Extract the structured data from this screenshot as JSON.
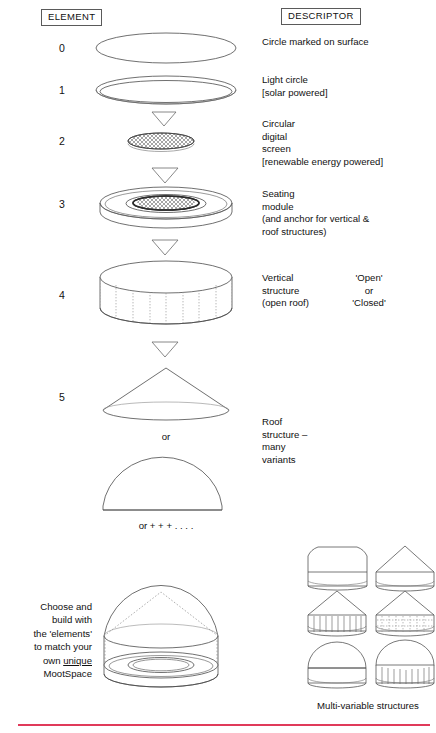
{
  "header": {
    "element_label": "ELEMENT",
    "descriptor_label": "DESCRIPTOR"
  },
  "elements": [
    {
      "number": "0",
      "icon": "flat-ellipse-outline",
      "descriptor": "Circle marked on surface",
      "descriptor_secondary": ""
    },
    {
      "number": "1",
      "icon": "double-ring-ellipse",
      "descriptor": "Light circle\n[solar powered]",
      "descriptor_secondary": ""
    },
    {
      "number": "2",
      "icon": "crosshatched-flat-disc",
      "descriptor": "Circular\ndigital\nscreen\n[renewable energy powered]",
      "descriptor_secondary": ""
    },
    {
      "number": "3",
      "icon": "seating-module-disc",
      "descriptor": "Seating\nmodule\n(and anchor for vertical &\nroof structures)",
      "descriptor_secondary": ""
    },
    {
      "number": "4",
      "icon": "dashed-cylinder",
      "descriptor": "Vertical\nstructure\n(open roof)",
      "descriptor_secondary": "'Open'\nor\n'Closed'"
    },
    {
      "number": "5",
      "icon": "cone-and-dome-roof",
      "descriptor": "Roof\nstructure –\nmany\nvariants",
      "descriptor_secondary": ""
    }
  ],
  "mini_labels": {
    "or": "or",
    "or_plus": "or + + + . . . ."
  },
  "caption": {
    "line1": "Choose and",
    "line2": "build with",
    "line3": "the 'elements'",
    "line4": "to match your",
    "line5_prefix": "own ",
    "line5_underlined": "unique",
    "line6": "MootSpace"
  },
  "multivariable": {
    "caption": "Multi-variable structures",
    "variants": [
      {
        "name": "rounded-roof-low-wall"
      },
      {
        "name": "conical-roof-plain-wall"
      },
      {
        "name": "conical-roof-ribbed-wall"
      },
      {
        "name": "conical-roof-dashed-wall"
      },
      {
        "name": "dome-roof-plain-wall"
      },
      {
        "name": "dome-roof-ribbed-wall"
      }
    ]
  },
  "composite": {
    "name": "assembled-mootspace-dome"
  },
  "colors": {
    "ink": "#4b4b4b",
    "text": "#111111",
    "rule_red": "#e03a5a",
    "dash_grey": "#9a9a9a"
  }
}
